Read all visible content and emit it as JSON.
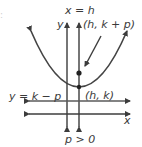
{
  "diagram": {
    "stray_mark": ":",
    "labels": {
      "axis_of_symmetry": "x = h",
      "y_axis": "y",
      "x_axis": "x",
      "focus": "(h, k + p)",
      "directrix": "y = k − p",
      "vertex": "(h, k)",
      "condition": "p > 0"
    },
    "points": [
      {
        "name": "focus",
        "coords": "(h, k + p)"
      },
      {
        "name": "vertex",
        "coords": "(h, k)"
      }
    ],
    "colors": {
      "ink": "#3c3c3c",
      "parabola": "#444444",
      "background": "#ffffff"
    }
  }
}
